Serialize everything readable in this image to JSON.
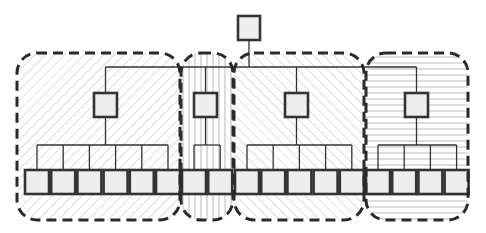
{
  "diagram": {
    "type": "hierarchical-tree-with-groups",
    "colors": {
      "stroke": "#333333",
      "node_fill": "#eeeeee",
      "hatch": "#bbbbbb",
      "background": "#ffffff"
    },
    "root": {
      "id": "root",
      "x": 238,
      "y": 16,
      "w": 22,
      "h": 24
    },
    "bus_y": 67,
    "groups": [
      {
        "id": "group-1",
        "pattern": "diag-back",
        "x": 17,
        "y": 53,
        "w": 163,
        "h": 167,
        "mid": {
          "x": 94,
          "y": 93
        },
        "leaves": 6,
        "leaf_start": 25
      },
      {
        "id": "group-2",
        "pattern": "vertical",
        "x": 181,
        "y": 53,
        "w": 52,
        "h": 167,
        "mid": {
          "x": 194,
          "y": 93
        },
        "leaves": 2,
        "leaf_start": 182
      },
      {
        "id": "group-3",
        "pattern": "diag-fwd",
        "x": 234,
        "y": 53,
        "w": 130,
        "h": 167,
        "mid": {
          "x": 285,
          "y": 93
        },
        "leaves": 5,
        "leaf_start": 235
      },
      {
        "id": "group-4",
        "pattern": "horizontal",
        "x": 366,
        "y": 53,
        "w": 102,
        "h": 167,
        "mid": {
          "x": 405,
          "y": 93
        },
        "leaves": 4,
        "leaf_start": 366
      }
    ],
    "leaf": {
      "y": 170,
      "w": 24,
      "h": 24,
      "gap": 2.2
    },
    "sub_bus_y": 145,
    "counts": {
      "mid_nodes": 4,
      "leaf_nodes": 17
    }
  }
}
